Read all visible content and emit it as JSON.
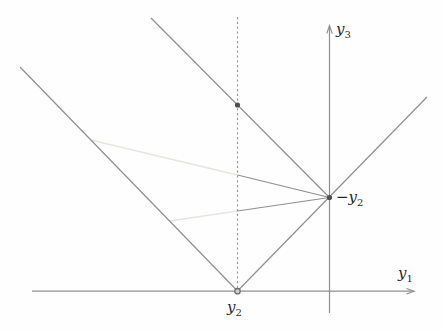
{
  "figure": {
    "labels": {
      "y1_axis": {
        "base": "y",
        "sub": "1"
      },
      "y3_axis": {
        "base": "y",
        "sub": "3"
      },
      "y2_point": {
        "base": "y",
        "sub": "2"
      },
      "neg_y2_point": {
        "prefix": "−",
        "base": "y",
        "sub": "2"
      }
    },
    "colors": {
      "line": "#8f8f8f",
      "dashed_line": "#9a9a9a",
      "light_line": "#e7e5df",
      "dot_fill": "#4f4f4f",
      "open_dot_fill": "#cfcfcf",
      "open_dot_stroke": "#6f6f6f",
      "text": "#262626"
    }
  }
}
